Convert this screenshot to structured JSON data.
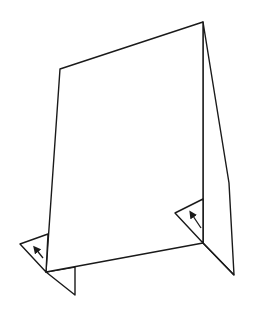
{
  "diagram": {
    "stroke_color": "#1a1a1a",
    "background": "#ffffff",
    "parts": {
      "front_panel": {
        "points": "60,69 203,22 203,243 46,272"
      },
      "side_panel": {
        "points": "203,22 229,183 234,275 203,243"
      },
      "left_flap": {
        "points": "20,244 48,234 46,272"
      },
      "left_bottom_tab": {
        "points": "46,272 75,267 75,295"
      },
      "right_flap": {
        "points": "175,213 203,199 203,243"
      },
      "right_bottom_tab": {
        "points": "203,243 234,275"
      }
    },
    "arrows": [
      {
        "name": "left-fold-arrow",
        "x1": 43,
        "y1": 258,
        "x2": 35,
        "y2": 248
      },
      {
        "name": "right-fold-arrow",
        "x1": 201,
        "y1": 228,
        "x2": 191,
        "y2": 213
      }
    ]
  }
}
